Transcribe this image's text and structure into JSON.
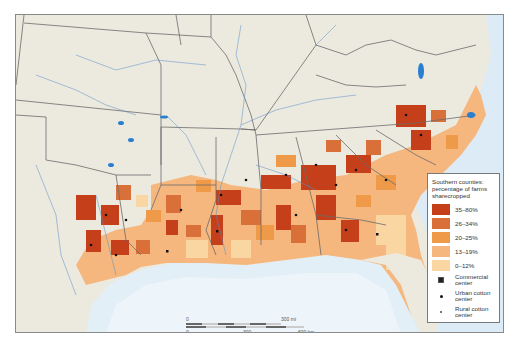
{
  "map": {
    "colors": {
      "land_background": "#ece9df",
      "water": "#d6e8f3",
      "gulf_deep": "#e6f1f8",
      "river": "#2a7fcf",
      "state_border": "#6b6b6b",
      "frame_border": "#8a8a8a"
    },
    "classes": [
      {
        "label": "35–80%",
        "color": "#c5401a"
      },
      {
        "label": "26–34%",
        "color": "#d9703a"
      },
      {
        "label": "20–25%",
        "color": "#ee9a48"
      },
      {
        "label": "13–19%",
        "color": "#f5b77e"
      },
      {
        "label": "0–12%",
        "color": "#fad6a2"
      }
    ]
  },
  "legend": {
    "title": "Southern counties: percentage of farms sharecropped",
    "classes": [
      {
        "label": "35–80%",
        "color": "#c5401a"
      },
      {
        "label": "26–34%",
        "color": "#d9703a"
      },
      {
        "label": "20–25%",
        "color": "#ee9a48"
      },
      {
        "label": "13–19%",
        "color": "#f5b77e"
      },
      {
        "label": "0–12%",
        "color": "#fad6a2"
      }
    ],
    "markers": [
      {
        "label": "Commercial center",
        "symbol": "square-dot"
      },
      {
        "label": "Urban cotton center",
        "symbol": "black-dot"
      },
      {
        "label": "Rural cotton center",
        "symbol": "small-dot"
      }
    ]
  },
  "scale_bar": {
    "miles": {
      "start": "0",
      "end": "300 mi"
    },
    "km": {
      "start": "0",
      "mid": "300",
      "end": "600 km"
    }
  }
}
